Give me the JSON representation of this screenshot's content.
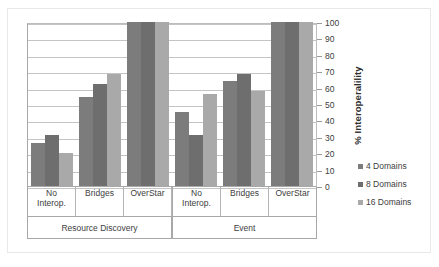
{
  "chart_data": {
    "type": "bar",
    "title": "",
    "xlabel": "",
    "ylabel": "% Interoperalility",
    "ylim": [
      0,
      100
    ],
    "ytick_step": 10,
    "yticks": [
      100,
      90,
      80,
      70,
      60,
      50,
      40,
      30,
      20,
      10,
      0
    ],
    "grid": true,
    "legend_position": "right",
    "groups": [
      "Resource Discovery",
      "Event"
    ],
    "categories": [
      "No Interop.",
      "Bridges",
      "OverStar",
      "No Interop.",
      "Bridges",
      "OverStar"
    ],
    "category_lines": [
      [
        "No",
        "Interop."
      ],
      [
        "Bridges",
        ""
      ],
      [
        "OverStar",
        ""
      ],
      [
        "No",
        "Interop."
      ],
      [
        "Bridges",
        ""
      ],
      [
        "OverStar",
        ""
      ]
    ],
    "series": [
      {
        "name": "4 Domains",
        "color": "#7c7c7c",
        "values": [
          26,
          54,
          100,
          45,
          64,
          100
        ]
      },
      {
        "name": "8 Domains",
        "color": "#6e6e6e",
        "values": [
          31,
          62,
          100,
          31,
          68,
          100
        ]
      },
      {
        "name": "16 Domains",
        "color": "#a9a9a9",
        "values": [
          20,
          68,
          100,
          56,
          58,
          100
        ]
      }
    ]
  },
  "legend": {
    "items": [
      {
        "label": "4 Domains"
      },
      {
        "label": "8 Domains"
      },
      {
        "label": "16 Domains"
      }
    ]
  }
}
